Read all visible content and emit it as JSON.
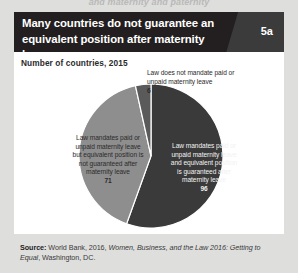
{
  "page": {
    "clipped_top_text": "and maternity and paternity"
  },
  "figure": {
    "header": {
      "title_line_1": "Many countries do not guarantee an",
      "title_line_2": "equivalent position after maternity leave",
      "badge": "5a",
      "band_color": "#231f20",
      "wedge_color": "#3b3b3c"
    },
    "subtitle": "Number of countries, 2015",
    "source": {
      "prefix": "Source:",
      "text_1": " World Bank, 2016, ",
      "italic_1": "Women, Business, and the Law 2016: Getting to Equal",
      "text_2": ", Washington, DC."
    }
  },
  "chart_data": {
    "type": "pie",
    "title": "Many countries do not guarantee an equivalent position after maternity leave",
    "subtitle": "Number of countries, 2015",
    "unit": "number of countries",
    "year": 2015,
    "total": 173,
    "legend_position": "inside-slices",
    "labels": [
      "Law mandates paid or unpaid maternity leave and equivalent position is guaranteed after maternity leave",
      "Law mandates paid or unpaid maternity leave but equivalent position is not guaranteed after maternity leave",
      "Law does not mandate paid or unpaid maternity leave"
    ],
    "values": [
      96,
      71,
      6
    ],
    "colors": [
      "#3a3a3a",
      "#8e8e8e",
      "#5a5a5a"
    ],
    "slices": [
      {
        "label": "Law mandates paid or unpaid maternity leave and equivalent position is guaranteed after maternity leave",
        "value": 96,
        "color": "#3a3a3a",
        "start_angle_deg": 0,
        "end_angle_deg": 199.8
      },
      {
        "label": "Law mandates paid or unpaid maternity leave but equivalent position is not guaranteed after maternity leave",
        "value": 71,
        "color": "#8e8e8e",
        "start_angle_deg": 199.8,
        "end_angle_deg": 347.5
      },
      {
        "label": "Law does not mandate paid or unpaid maternity leave",
        "value": 6,
        "color": "#5a5a5a",
        "start_angle_deg": 347.5,
        "end_angle_deg": 360
      }
    ]
  }
}
